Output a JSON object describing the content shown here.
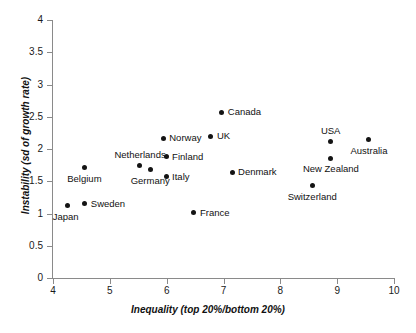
{
  "chart_data": {
    "type": "scatter",
    "title": "",
    "xlabel": "Inequality (top 20%/bottom 20%)",
    "ylabel": "Instability (sd of growth rate)",
    "xlim": [
      4,
      10
    ],
    "ylim": [
      0,
      4
    ],
    "xticks": [
      "4",
      "5",
      "6",
      "7",
      "8",
      "9",
      "10"
    ],
    "xtick_values": [
      4,
      5,
      6,
      7,
      8,
      9,
      10
    ],
    "yticks": [
      "0",
      "0.5",
      "1",
      "1.5",
      "2",
      "2.5",
      "3",
      "3.5",
      "4"
    ],
    "ytick_values": [
      0,
      0.5,
      1,
      1.5,
      2,
      2.5,
      3,
      3.5,
      4
    ],
    "grid": false,
    "legend": "none",
    "marker_color": "#141414",
    "axis_color": "#8a8a8a",
    "points": [
      {
        "label": "Japan",
        "x": 4.26,
        "y": 1.12,
        "label_pos": "below-left"
      },
      {
        "label": "Sweden",
        "x": 4.56,
        "y": 1.15,
        "label_pos": "right"
      },
      {
        "label": "Belgium",
        "x": 4.55,
        "y": 1.71,
        "label_pos": "below"
      },
      {
        "label": "Netherlands",
        "x": 5.53,
        "y": 1.74,
        "label_pos": "above"
      },
      {
        "label": "Germany",
        "x": 5.71,
        "y": 1.68,
        "label_pos": "below"
      },
      {
        "label": "Italy",
        "x": 5.99,
        "y": 1.57,
        "label_pos": "right"
      },
      {
        "label": "Finland",
        "x": 5.99,
        "y": 1.88,
        "label_pos": "right"
      },
      {
        "label": "Norway",
        "x": 5.94,
        "y": 2.17,
        "label_pos": "right"
      },
      {
        "label": "UK",
        "x": 6.78,
        "y": 2.2,
        "label_pos": "right"
      },
      {
        "label": "Canada",
        "x": 6.97,
        "y": 2.57,
        "label_pos": "right"
      },
      {
        "label": "France",
        "x": 6.48,
        "y": 1.01,
        "label_pos": "right"
      },
      {
        "label": "Denmark",
        "x": 7.15,
        "y": 1.64,
        "label_pos": "right"
      },
      {
        "label": "Switzerland",
        "x": 8.56,
        "y": 1.43,
        "label_pos": "below"
      },
      {
        "label": "New Zealand",
        "x": 8.89,
        "y": 1.86,
        "label_pos": "below"
      },
      {
        "label": "USA",
        "x": 8.89,
        "y": 2.11,
        "label_pos": "above"
      },
      {
        "label": "Australia",
        "x": 9.56,
        "y": 2.14,
        "label_pos": "below"
      }
    ]
  }
}
